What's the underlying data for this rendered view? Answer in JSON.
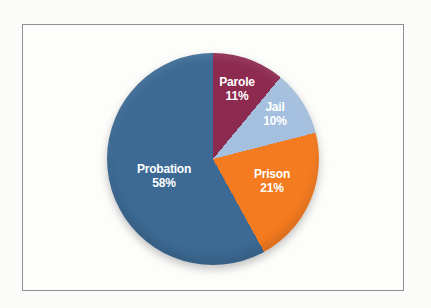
{
  "frame": {
    "border_color": "#8e9093",
    "background": "#fdfdfc"
  },
  "chart_data": {
    "type": "pie",
    "legend": "none",
    "labels_position": "inside",
    "start_angle_deg": 0,
    "direction": "clockwise",
    "label_text_color": "#ffffff",
    "categories": [
      "Parole",
      "Jail",
      "Prison",
      "Probation"
    ],
    "values": [
      11,
      10,
      21,
      58
    ],
    "slices": [
      {
        "name": "Parole",
        "value": 11,
        "pct_label": "11%",
        "color": "#8d2a4f"
      },
      {
        "name": "Jail",
        "value": 10,
        "pct_label": "10%",
        "color": "#a5c0de"
      },
      {
        "name": "Prison",
        "value": 21,
        "pct_label": "21%",
        "color": "#f47b20"
      },
      {
        "name": "Probation",
        "value": 58,
        "pct_label": "58%",
        "color": "#3c6a94"
      }
    ]
  }
}
